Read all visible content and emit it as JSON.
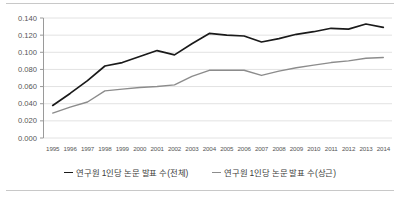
{
  "chart_data": {
    "type": "line",
    "title": "",
    "xlabel": "",
    "ylabel": "",
    "grid": true,
    "legend_position": "bottom-center",
    "categories": [
      "1995",
      "1996",
      "1997",
      "1998",
      "1999",
      "2000",
      "2001",
      "2002",
      "2003",
      "2004",
      "2005",
      "2006",
      "2007",
      "2008",
      "2009",
      "2010",
      "2011",
      "2012",
      "2013",
      "2014"
    ],
    "ylim": [
      0.0,
      0.14
    ],
    "ytick_labels": [
      "0.140",
      "0.120",
      "0.100",
      "0.080",
      "0.060",
      "0.040",
      "0.020",
      "0.000"
    ],
    "ytick_values": [
      0.14,
      0.12,
      0.1,
      0.08,
      0.06,
      0.04,
      0.02,
      0.0
    ],
    "series": [
      {
        "name": "연구원 1인당 논문 발표 수(전체)",
        "color": "#1a1a1a",
        "values": [
          0.038,
          0.052,
          0.067,
          0.084,
          0.088,
          0.095,
          0.102,
          0.097,
          0.11,
          0.122,
          0.12,
          0.119,
          0.112,
          0.116,
          0.121,
          0.124,
          0.128,
          0.127,
          0.133,
          0.129
        ]
      },
      {
        "name": "연구원 1인당 논문 발표 수(상근)",
        "color": "#8c8c8c",
        "values": [
          0.029,
          0.036,
          0.042,
          0.055,
          0.057,
          0.059,
          0.06,
          0.062,
          0.072,
          0.079,
          0.079,
          0.079,
          0.073,
          0.078,
          0.082,
          0.085,
          0.088,
          0.09,
          0.093,
          0.094
        ]
      }
    ]
  },
  "legend": {
    "entries": [
      {
        "label": "연구원 1인당 논문 발표 수(전체)",
        "color": "#1a1a1a"
      },
      {
        "label": "연구원 1인당 논문 발표 수(상근)",
        "color": "#8c8c8c"
      }
    ]
  },
  "axis": {
    "line_color": "#9a9a9a",
    "grid_color": "#e2e2e2"
  }
}
